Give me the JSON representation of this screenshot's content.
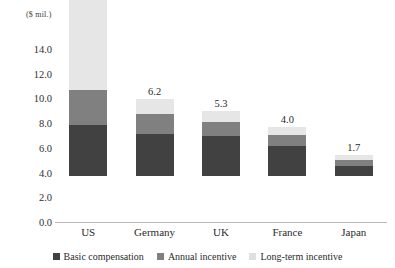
{
  "chart_data": {
    "type": "bar",
    "stacked": true,
    "title": "",
    "xlabel": "",
    "ylabel": "($ mil.)",
    "ylim": [
      0.0,
      14.0
    ],
    "yticks": [
      "14.0",
      "12.0",
      "10.0",
      "8.0",
      "6.0",
      "4.0",
      "2.0",
      "0.0"
    ],
    "ytick_values": [
      14.0,
      12.0,
      10.0,
      8.0,
      6.0,
      4.0,
      2.0,
      0.0
    ],
    "grid": false,
    "legend_position": "bottom",
    "categories": [
      "US",
      "Germany",
      "UK",
      "France",
      "Japan"
    ],
    "totals": [
      14.3,
      6.2,
      5.3,
      4.0,
      1.7
    ],
    "total_labels": [
      "14.3",
      "6.2",
      "5.3",
      "4.0",
      "1.7"
    ],
    "series": [
      {
        "name": "Basic compensation",
        "color": "#414141",
        "values": [
          4.1,
          3.4,
          3.2,
          2.4,
          0.8
        ]
      },
      {
        "name": "Annual incentive",
        "color": "#808080",
        "values": [
          2.9,
          1.6,
          1.2,
          0.9,
          0.5
        ]
      },
      {
        "name": "Long-term incentive",
        "color": "#e6e6e6",
        "values": [
          7.3,
          1.2,
          0.9,
          0.7,
          0.4
        ]
      }
    ]
  },
  "legend": {
    "items": [
      {
        "label": "Basic compensation",
        "swatch": "basic"
      },
      {
        "label": "Annual incentive",
        "swatch": "ann"
      },
      {
        "label": "Long-term incentive",
        "swatch": "lt"
      }
    ]
  }
}
